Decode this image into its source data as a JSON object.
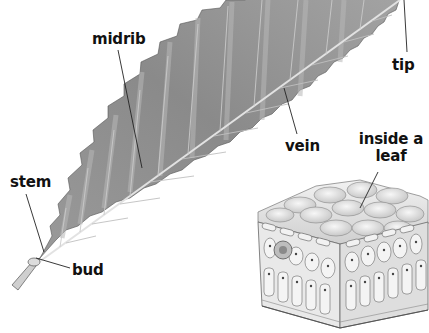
{
  "diagram": {
    "labels": {
      "midrib": "midrib",
      "tip": "tip",
      "vein": "vein",
      "inside_line1": "inside a",
      "inside_line2": "leaf",
      "stem": "stem",
      "bud": "bud"
    },
    "colors": {
      "leaf_fill": "#8f8f8f",
      "leaf_light": "#bdbdbd",
      "leaf_dark": "#6a6a6a",
      "midrib": "#d9d9d9",
      "cell_fill": "#e4e4e4",
      "cell_edge": "#6e6e6e",
      "text": "#111111",
      "leader_line": "#222222",
      "background": "#ffffff"
    }
  }
}
